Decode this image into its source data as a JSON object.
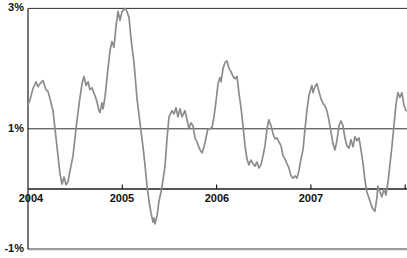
{
  "chart_data": {
    "type": "line",
    "title": "",
    "xlabel": "",
    "ylabel": "",
    "legend": "none",
    "grid": "horizontal-only",
    "x_tick_labels": [
      "2004",
      "2005",
      "2006",
      "2007"
    ],
    "x_tick_years": [
      2004,
      2005,
      2006,
      2007
    ],
    "x_axis_tick_mark_years": [
      2005,
      2006,
      2007,
      2008
    ],
    "y_tick_labels": [
      "3%",
      "1%",
      "-1%"
    ],
    "y_tick_values": [
      3,
      1,
      -1
    ],
    "xlim": [
      2004,
      2008.01
    ],
    "ylim": [
      -1,
      3
    ],
    "background_color": "#ffffff",
    "axis_color": "#1c1c1c",
    "label_color": "#111111",
    "gridlines": [
      {
        "value": 3,
        "color": "#2e2e2e",
        "width": 1
      },
      {
        "value": 1,
        "color": "#2e2e2e",
        "width": 1
      },
      {
        "value": 0,
        "color": "#1c1c1c",
        "width": 1.3
      },
      {
        "value": -1,
        "color": "#9c9c9c",
        "width": 2.2
      }
    ],
    "series": [
      {
        "name": "percent-series",
        "color": "#8c8c8c",
        "stroke_width": 1.7,
        "points": [
          [
            2004.0,
            1.4
          ],
          [
            2004.021,
            1.48
          ],
          [
            2004.053,
            1.67
          ],
          [
            2004.085,
            1.78
          ],
          [
            2004.106,
            1.7
          ],
          [
            2004.127,
            1.75
          ],
          [
            2004.159,
            1.8
          ],
          [
            2004.191,
            1.65
          ],
          [
            2004.212,
            1.62
          ],
          [
            2004.233,
            1.5
          ],
          [
            2004.265,
            1.3
          ],
          [
            2004.297,
            0.85
          ],
          [
            2004.318,
            0.55
          ],
          [
            2004.339,
            0.25
          ],
          [
            2004.361,
            0.08
          ],
          [
            2004.382,
            0.2
          ],
          [
            2004.403,
            0.07
          ],
          [
            2004.424,
            0.12
          ],
          [
            2004.445,
            0.3
          ],
          [
            2004.477,
            0.55
          ],
          [
            2004.509,
            1.0
          ],
          [
            2004.541,
            1.4
          ],
          [
            2004.573,
            1.75
          ],
          [
            2004.594,
            1.87
          ],
          [
            2004.615,
            1.72
          ],
          [
            2004.636,
            1.78
          ],
          [
            2004.657,
            1.65
          ],
          [
            2004.679,
            1.68
          ],
          [
            2004.71,
            1.55
          ],
          [
            2004.732,
            1.45
          ],
          [
            2004.753,
            1.3
          ],
          [
            2004.764,
            1.27
          ],
          [
            2004.785,
            1.43
          ],
          [
            2004.796,
            1.33
          ],
          [
            2004.817,
            1.53
          ],
          [
            2004.848,
            2.0
          ],
          [
            2004.87,
            2.3
          ],
          [
            2004.891,
            2.45
          ],
          [
            2004.912,
            2.35
          ],
          [
            2004.933,
            2.7
          ],
          [
            2004.954,
            2.95
          ],
          [
            2004.976,
            2.8
          ],
          [
            2004.997,
            2.95
          ],
          [
            2005.029,
            3.0
          ],
          [
            2005.05,
            2.95
          ],
          [
            2005.071,
            2.85
          ],
          [
            2005.092,
            2.5
          ],
          [
            2005.124,
            2.1
          ],
          [
            2005.156,
            1.5
          ],
          [
            2005.188,
            1.1
          ],
          [
            2005.219,
            0.7
          ],
          [
            2005.241,
            0.4
          ],
          [
            2005.262,
            0.05
          ],
          [
            2005.283,
            -0.2
          ],
          [
            2005.304,
            -0.4
          ],
          [
            2005.326,
            -0.55
          ],
          [
            2005.336,
            -0.48
          ],
          [
            2005.347,
            -0.58
          ],
          [
            2005.368,
            -0.45
          ],
          [
            2005.389,
            -0.2
          ],
          [
            2005.41,
            -0.05
          ],
          [
            2005.432,
            0.15
          ],
          [
            2005.453,
            0.38
          ],
          [
            2005.474,
            0.83
          ],
          [
            2005.495,
            1.2
          ],
          [
            2005.527,
            1.3
          ],
          [
            2005.548,
            1.25
          ],
          [
            2005.569,
            1.35
          ],
          [
            2005.591,
            1.2
          ],
          [
            2005.612,
            1.33
          ],
          [
            2005.633,
            1.2
          ],
          [
            2005.665,
            1.3
          ],
          [
            2005.686,
            1.15
          ],
          [
            2005.707,
            1.0
          ],
          [
            2005.728,
            1.1
          ],
          [
            2005.75,
            1.05
          ],
          [
            2005.771,
            0.85
          ],
          [
            2005.792,
            0.78
          ],
          [
            2005.824,
            0.65
          ],
          [
            2005.845,
            0.6
          ],
          [
            2005.866,
            0.7
          ],
          [
            2005.888,
            0.85
          ],
          [
            2005.909,
            1.0
          ],
          [
            2005.93,
            1.0
          ],
          [
            2005.951,
            1.02
          ],
          [
            2005.972,
            1.2
          ],
          [
            2005.994,
            1.45
          ],
          [
            2006.015,
            1.75
          ],
          [
            2006.036,
            1.85
          ],
          [
            2006.047,
            1.78
          ],
          [
            2006.068,
            2.0
          ],
          [
            2006.089,
            2.1
          ],
          [
            2006.11,
            2.13
          ],
          [
            2006.131,
            2.0
          ],
          [
            2006.153,
            1.95
          ],
          [
            2006.174,
            1.87
          ],
          [
            2006.195,
            1.83
          ],
          [
            2006.216,
            1.87
          ],
          [
            2006.237,
            1.6
          ],
          [
            2006.259,
            1.35
          ],
          [
            2006.28,
            1.05
          ],
          [
            2006.301,
            0.72
          ],
          [
            2006.322,
            0.5
          ],
          [
            2006.343,
            0.4
          ],
          [
            2006.365,
            0.48
          ],
          [
            2006.386,
            0.42
          ],
          [
            2006.407,
            0.38
          ],
          [
            2006.428,
            0.45
          ],
          [
            2006.449,
            0.35
          ],
          [
            2006.471,
            0.4
          ],
          [
            2006.492,
            0.55
          ],
          [
            2006.513,
            0.72
          ],
          [
            2006.534,
            1.0
          ],
          [
            2006.555,
            1.15
          ],
          [
            2006.577,
            1.05
          ],
          [
            2006.598,
            0.92
          ],
          [
            2006.619,
            0.83
          ],
          [
            2006.64,
            0.85
          ],
          [
            2006.661,
            0.78
          ],
          [
            2006.683,
            0.72
          ],
          [
            2006.704,
            0.55
          ],
          [
            2006.725,
            0.5
          ],
          [
            2006.746,
            0.42
          ],
          [
            2006.767,
            0.35
          ],
          [
            2006.789,
            0.22
          ],
          [
            2006.81,
            0.18
          ],
          [
            2006.831,
            0.22
          ],
          [
            2006.852,
            0.18
          ],
          [
            2006.873,
            0.3
          ],
          [
            2006.895,
            0.5
          ],
          [
            2006.916,
            0.65
          ],
          [
            2006.937,
            1.0
          ],
          [
            2006.958,
            1.3
          ],
          [
            2006.979,
            1.55
          ],
          [
            2007.001,
            1.68
          ],
          [
            2007.011,
            1.72
          ],
          [
            2007.022,
            1.6
          ],
          [
            2007.043,
            1.7
          ],
          [
            2007.064,
            1.75
          ],
          [
            2007.085,
            1.62
          ],
          [
            2007.107,
            1.5
          ],
          [
            2007.128,
            1.42
          ],
          [
            2007.149,
            1.38
          ],
          [
            2007.17,
            1.3
          ],
          [
            2007.191,
            1.15
          ],
          [
            2007.213,
            0.95
          ],
          [
            2007.234,
            0.75
          ],
          [
            2007.255,
            0.65
          ],
          [
            2007.276,
            0.8
          ],
          [
            2007.297,
            1.05
          ],
          [
            2007.319,
            1.13
          ],
          [
            2007.34,
            1.05
          ],
          [
            2007.361,
            0.85
          ],
          [
            2007.382,
            0.72
          ],
          [
            2007.404,
            0.68
          ],
          [
            2007.425,
            0.82
          ],
          [
            2007.446,
            0.7
          ],
          [
            2007.467,
            0.87
          ],
          [
            2007.488,
            0.8
          ],
          [
            2007.51,
            0.85
          ],
          [
            2007.531,
            0.65
          ],
          [
            2007.552,
            0.43
          ],
          [
            2007.573,
            0.15
          ],
          [
            2007.594,
            -0.05
          ],
          [
            2007.616,
            -0.15
          ],
          [
            2007.637,
            -0.25
          ],
          [
            2007.658,
            -0.33
          ],
          [
            2007.679,
            -0.37
          ],
          [
            2007.7,
            -0.15
          ],
          [
            2007.711,
            0.05
          ],
          [
            2007.732,
            -0.05
          ],
          [
            2007.753,
            -0.13
          ],
          [
            2007.774,
            0.0
          ],
          [
            2007.796,
            -0.1
          ],
          [
            2007.817,
            0.1
          ],
          [
            2007.838,
            0.4
          ],
          [
            2007.859,
            0.7
          ],
          [
            2007.88,
            1.05
          ],
          [
            2007.902,
            1.4
          ],
          [
            2007.923,
            1.6
          ],
          [
            2007.944,
            1.52
          ],
          [
            2007.965,
            1.6
          ],
          [
            2007.986,
            1.4
          ],
          [
            2008.008,
            1.3
          ]
        ]
      }
    ]
  }
}
